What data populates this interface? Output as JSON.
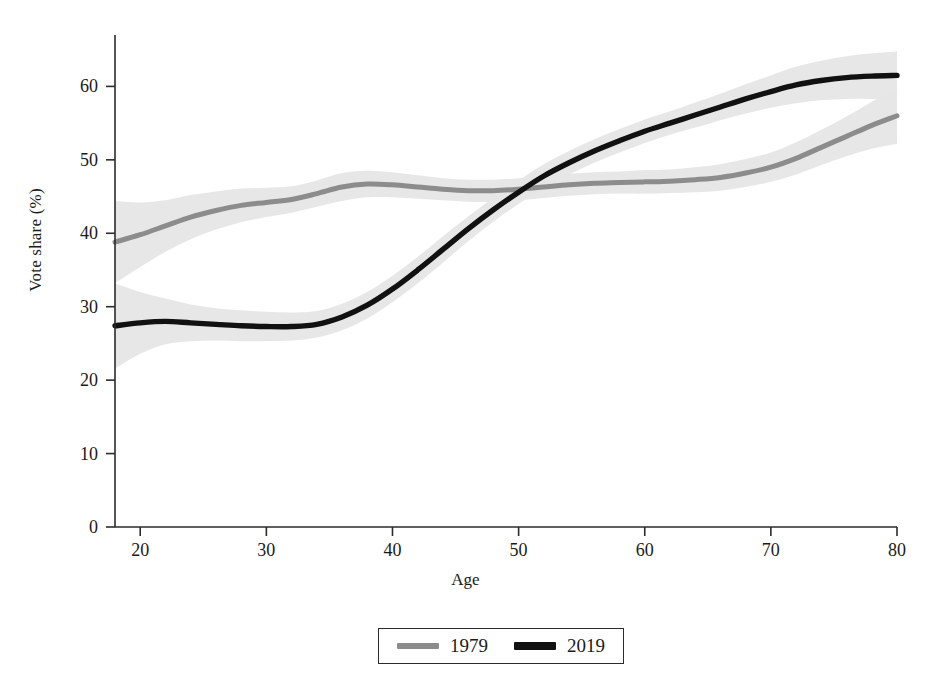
{
  "figure": {
    "background": "#ffffff",
    "axis_color": "#2b2b2b"
  },
  "axes": {
    "ylabel": "Vote share (%)",
    "xlabel": "Age",
    "yticks": [
      "0",
      "10",
      "20",
      "30",
      "40",
      "50",
      "60"
    ],
    "xticks": [
      "20",
      "30",
      "40",
      "50",
      "60",
      "70",
      "80"
    ]
  },
  "legend": {
    "entries": [
      {
        "label": "1979",
        "color": "#8c8c8c"
      },
      {
        "label": "2019",
        "color": "#111111"
      }
    ]
  },
  "chart_data": {
    "type": "line",
    "title": "",
    "subtitle": "",
    "xlabel": "Age",
    "ylabel": "Vote share (%)",
    "xlim": [
      18,
      80
    ],
    "ylim": [
      0,
      67
    ],
    "xticks": [
      20,
      30,
      40,
      50,
      60,
      70,
      80
    ],
    "yticks": [
      0,
      10,
      20,
      30,
      40,
      50,
      60
    ],
    "grid": false,
    "legend_position": "bottom-center",
    "annotations": [],
    "band_type": "confidence interval (shaded)",
    "band_color": "#e6e6e6",
    "x": [
      18,
      20,
      22,
      24,
      26,
      28,
      30,
      32,
      34,
      36,
      38,
      40,
      42,
      44,
      46,
      48,
      50,
      52,
      54,
      56,
      58,
      60,
      62,
      64,
      66,
      68,
      70,
      72,
      74,
      76,
      78,
      80
    ],
    "series": [
      {
        "name": "1979",
        "color": "#8c8c8c",
        "values": [
          38.8,
          39.8,
          41.0,
          42.2,
          43.1,
          43.8,
          44.2,
          44.6,
          45.4,
          46.3,
          46.7,
          46.6,
          46.3,
          46.0,
          45.8,
          45.8,
          46.0,
          46.3,
          46.6,
          46.8,
          46.9,
          47.0,
          47.1,
          47.3,
          47.6,
          48.2,
          49.0,
          50.2,
          51.7,
          53.2,
          54.7,
          56.0
        ],
        "lower": [
          33.2,
          35.4,
          37.5,
          39.2,
          40.5,
          41.5,
          42.2,
          42.8,
          43.6,
          44.4,
          44.9,
          44.9,
          44.7,
          44.5,
          44.3,
          44.3,
          44.5,
          44.8,
          45.1,
          45.3,
          45.4,
          45.4,
          45.5,
          45.6,
          45.8,
          46.3,
          47.0,
          48.0,
          49.3,
          50.5,
          51.5,
          52.2
        ],
        "upper": [
          44.4,
          44.2,
          44.5,
          45.2,
          45.7,
          46.1,
          46.2,
          46.4,
          47.2,
          48.2,
          48.5,
          48.3,
          47.9,
          47.5,
          47.3,
          47.3,
          47.5,
          47.8,
          48.1,
          48.3,
          48.4,
          48.6,
          48.7,
          49.0,
          49.4,
          50.1,
          51.0,
          52.4,
          54.1,
          55.9,
          57.9,
          59.8
        ]
      },
      {
        "name": "2019",
        "color": "#111111",
        "values": [
          27.4,
          27.8,
          28.0,
          27.8,
          27.6,
          27.4,
          27.3,
          27.3,
          27.6,
          28.6,
          30.2,
          32.4,
          35.0,
          37.8,
          40.6,
          43.2,
          45.6,
          47.8,
          49.6,
          51.2,
          52.6,
          53.9,
          55.0,
          56.1,
          57.2,
          58.3,
          59.3,
          60.2,
          60.8,
          61.2,
          61.4,
          61.5
        ],
        "lower": [
          21.6,
          23.6,
          24.9,
          25.3,
          25.4,
          25.3,
          25.3,
          25.4,
          25.8,
          26.8,
          28.4,
          30.6,
          33.2,
          36.0,
          38.9,
          41.6,
          44.0,
          46.2,
          48.0,
          49.6,
          51.0,
          52.3,
          53.4,
          54.4,
          55.4,
          56.3,
          57.1,
          57.7,
          58.1,
          58.3,
          58.3,
          58.2
        ],
        "upper": [
          33.2,
          32.0,
          31.1,
          30.3,
          29.8,
          29.5,
          29.3,
          29.2,
          29.4,
          30.4,
          32.0,
          34.2,
          36.8,
          39.6,
          42.3,
          44.8,
          47.2,
          49.4,
          51.2,
          52.8,
          54.2,
          55.5,
          56.6,
          57.8,
          59.0,
          60.3,
          61.5,
          62.7,
          63.5,
          64.1,
          64.5,
          64.8
        ]
      }
    ]
  }
}
